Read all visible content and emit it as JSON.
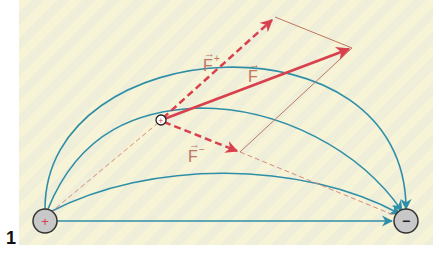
{
  "figure": {
    "number": "1"
  },
  "charges": {
    "source_positive": {
      "sign": "+",
      "x": 45,
      "y": 221,
      "r": 12
    },
    "sink_negative": {
      "sign": "−",
      "x": 406,
      "y": 221,
      "r": 12
    },
    "test_charge": {
      "sign": "+",
      "x": 161,
      "y": 120,
      "r": 5
    }
  },
  "labels": {
    "f_plus": "F",
    "f_plus_sup": "+",
    "f_total": "F",
    "f_minus": "F",
    "f_minus_sup": "−",
    "vec_arrow": "→"
  },
  "colors": {
    "field_line": "#2f8fa8",
    "force": "#d9404e",
    "construction": "#c0765e",
    "charge_fill": "#c8c8c8",
    "charge_stroke": "#333333",
    "label": "#c0765e"
  },
  "field_lines": [
    {
      "name": "outer-arc",
      "d": "M45,209 C45,30 406,10 406,209"
    },
    {
      "name": "upper-arc",
      "d": "M48,209 C80,130 140,110 200,108 C280,108 360,150 402,211"
    },
    {
      "name": "middle-arc",
      "d": "M50,212 C150,160 300,160 400,214"
    },
    {
      "name": "straight-line",
      "d": "M57,221 L392,221"
    }
  ],
  "vectors": {
    "f_plus": {
      "x1": 161,
      "y1": 120,
      "x2": 275,
      "y2": 17
    },
    "f_total": {
      "x1": 161,
      "y1": 120,
      "x2": 352,
      "y2": 48
    },
    "f_minus": {
      "x1": 161,
      "y1": 120,
      "x2": 240,
      "y2": 152
    }
  }
}
